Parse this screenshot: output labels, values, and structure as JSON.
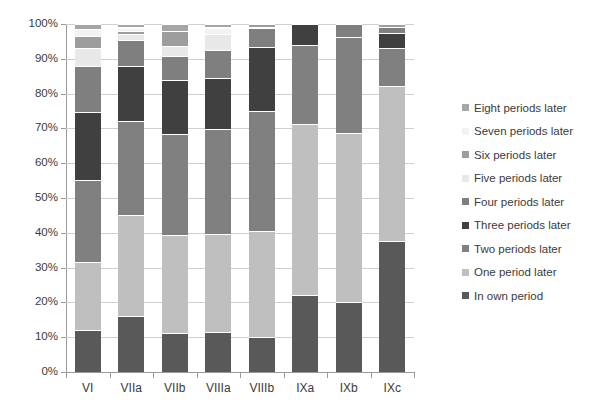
{
  "chart_data": {
    "type": "bar",
    "subtype": "stacked-percentage",
    "title": "",
    "xlabel": "",
    "ylabel": "",
    "ylim": [
      0,
      100
    ],
    "ytick_labels": [
      "100%",
      "90%",
      "80%",
      "70%",
      "60%",
      "50%",
      "40%",
      "30%",
      "20%",
      "10%",
      "0%"
    ],
    "ytick_values": [
      100,
      90,
      80,
      70,
      60,
      50,
      40,
      30,
      20,
      10,
      0
    ],
    "grid": true,
    "legend_position": "right",
    "categories": [
      "VI",
      "VIIa",
      "VIIb",
      "VIIIa",
      "VIIIb",
      "IXa",
      "IXb",
      "IXc"
    ],
    "series": [
      {
        "name": "In own period",
        "color": "#595959",
        "values": [
          12.0,
          16.0,
          11.3,
          11.6,
          10.0,
          22.0,
          20.2,
          37.7
        ]
      },
      {
        "name": "One period later",
        "color": "#bfbfbf",
        "values": [
          19.7,
          29.0,
          28.0,
          28.2,
          30.5,
          49.4,
          48.6,
          44.5
        ]
      },
      {
        "name": "Two periods later",
        "color": "#808080",
        "values": [
          23.5,
          27.0,
          29.0,
          30.0,
          34.4,
          22.6,
          27.5,
          11.0
        ]
      },
      {
        "name": "Three periods later",
        "color": "#404040",
        "values": [
          19.5,
          15.8,
          15.6,
          14.8,
          18.4,
          6.0,
          0.0,
          4.3
        ]
      },
      {
        "name": "Four periods later",
        "color": "#7f7f7f",
        "values": [
          13.3,
          7.7,
          6.8,
          7.8,
          5.7,
          0.0,
          3.7,
          1.5
        ]
      },
      {
        "name": "Five periods later",
        "color": "#e8e8e8",
        "values": [
          5.2,
          1.5,
          3.0,
          4.6,
          0.0,
          0.0,
          0.0,
          0.0
        ]
      },
      {
        "name": "Six periods later",
        "color": "#9d9d9d",
        "values": [
          3.3,
          1.0,
          4.3,
          0.0,
          1.0,
          0.0,
          0.0,
          1.0
        ]
      },
      {
        "name": "Seven periods later",
        "color": "#f2f2f2",
        "values": [
          2.0,
          1.0,
          0.0,
          2.0,
          0.0,
          0.0,
          0.0,
          0.0
        ]
      },
      {
        "name": "Eight periods later",
        "color": "#a6a6a6",
        "values": [
          1.5,
          1.0,
          2.0,
          1.0,
          0.0,
          0.0,
          0.0,
          0.0
        ]
      }
    ],
    "legend_order_top_to_bottom": [
      "Eight periods later",
      "Seven periods later",
      "Six periods later",
      "Five periods later",
      "Four periods later",
      "Three periods later",
      "Two periods later",
      "One period later",
      "In own period"
    ]
  }
}
